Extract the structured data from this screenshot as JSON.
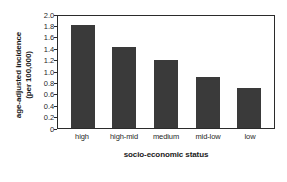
{
  "chart_data": {
    "type": "bar",
    "title": "",
    "subtitle": "",
    "categories": [
      "high",
      "high-mid",
      "medium",
      "mid-low",
      "low"
    ],
    "values": [
      1.8,
      1.42,
      1.19,
      0.9,
      0.71
    ],
    "xlabel": "socio-economic status",
    "ylabel_line1": "age-adjusted incidence",
    "ylabel_line2": "(per 100,000)",
    "ylim": [
      0,
      2.0
    ],
    "yticks": [
      "2.0",
      "1.8",
      "1.6",
      "1.4",
      "1.2",
      "1.0",
      "0.8",
      "0.6",
      "0.4",
      "0.2",
      "0"
    ],
    "ytick_values": [
      2.0,
      1.8,
      1.6,
      1.4,
      1.2,
      1.0,
      0.8,
      0.6,
      0.4,
      0.2,
      0
    ],
    "grid": false,
    "legend": null,
    "bar_color": "#3a3a3a",
    "frame_color": "#2b2b2b",
    "background": "#ffffff"
  }
}
